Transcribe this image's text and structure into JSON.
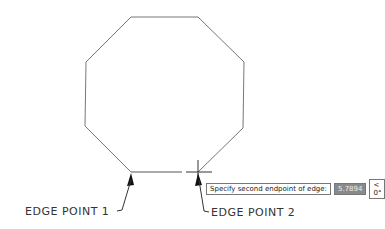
{
  "drawing": {
    "shape": "octagon",
    "octagon_points": [
      [
        131,
        17
      ],
      [
        198,
        17
      ],
      [
        244,
        62
      ],
      [
        243,
        128
      ],
      [
        198,
        172
      ]
    ],
    "octagon_points_left": [
      [
        131,
        172
      ],
      [
        85,
        126
      ],
      [
        86,
        62
      ],
      [
        131,
        17
      ]
    ],
    "rubber_band_edge": {
      "x1": 131,
      "y1": 172,
      "x2": 182,
      "y2": 172
    },
    "cursor": {
      "x": 198,
      "y": 172
    }
  },
  "labels": {
    "edge_point_1": "EDGE POINT 1",
    "edge_point_2": "EDGE POINT 2"
  },
  "tooltip": {
    "prompt": "Specify second endpoint of edge:",
    "value": "5.7894",
    "angle": "< 0°"
  }
}
